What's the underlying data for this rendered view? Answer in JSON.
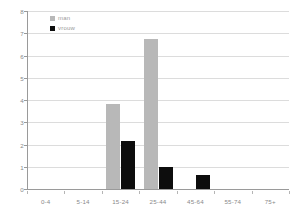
{
  "chart_data": {
    "type": "bar",
    "title": "",
    "xlabel": "",
    "ylabel": "",
    "categories": [
      "0-4",
      "5-14",
      "15-24",
      "25-44",
      "45-64",
      "55-74",
      "75+"
    ],
    "series": [
      {
        "name": "man",
        "color": "#b8b8b8",
        "values": [
          0,
          0,
          3.8,
          6.75,
          0,
          0,
          0
        ]
      },
      {
        "name": "vrouw",
        "color": "#0d0d0d",
        "values": [
          0,
          0,
          2.15,
          1.0,
          0.65,
          0,
          0
        ]
      }
    ],
    "ylim": [
      0,
      8
    ],
    "yticks": [
      0,
      1,
      2,
      3,
      4,
      5,
      6,
      7,
      8
    ],
    "grid": true,
    "legend_position": "top-left"
  },
  "legend": {
    "items": [
      {
        "label": "man",
        "color": "#b8b8b8"
      },
      {
        "label": "vrouw",
        "color": "#0d0d0d"
      }
    ]
  },
  "colors": {
    "axis": "#9a9a9a",
    "grid": "#dcdcdc",
    "tick_text": "#8a8a8a",
    "background": "#ffffff"
  }
}
